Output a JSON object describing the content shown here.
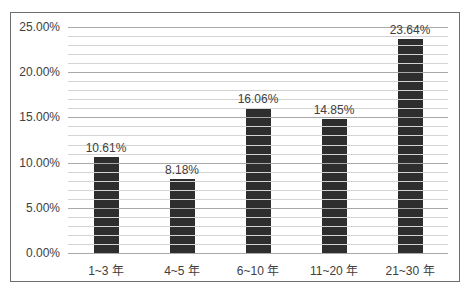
{
  "chart_data": {
    "type": "bar",
    "title": "",
    "xlabel": "",
    "ylabel": "",
    "categories": [
      "1~3 年",
      "4~5 年",
      "6~10 年",
      "11~20 年",
      "21~30 年"
    ],
    "values": [
      10.61,
      8.18,
      16.06,
      14.85,
      23.64
    ],
    "value_labels": [
      "10.61%",
      "8.18%",
      "16.06%",
      "14.85%",
      "23.64%"
    ],
    "ylim": [
      0,
      25
    ],
    "yticks": [
      "0.00%",
      "5.00%",
      "10.00%",
      "15.00%",
      "20.00%",
      "25.00%"
    ],
    "grid": true,
    "minor_grid_step": 1,
    "legend": null,
    "bar_color": "#2e2e2e"
  }
}
